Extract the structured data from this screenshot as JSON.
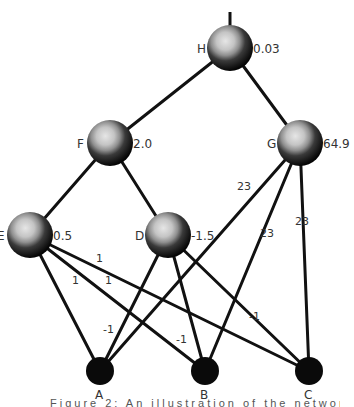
{
  "diagram": {
    "type": "neural-network",
    "nodes": [
      {
        "id": "H",
        "label": "H",
        "value": "0.03",
        "x": 230,
        "y": 48,
        "kind": "hidden"
      },
      {
        "id": "F",
        "label": "F",
        "value": "2.0",
        "x": 110,
        "y": 143,
        "kind": "hidden"
      },
      {
        "id": "G",
        "label": "G",
        "value": "64.9",
        "x": 300,
        "y": 143,
        "kind": "hidden"
      },
      {
        "id": "E",
        "label": "E",
        "value": "0.5",
        "x": 30,
        "y": 235,
        "kind": "hidden"
      },
      {
        "id": "D",
        "label": "D",
        "value": "-1.5",
        "x": 168,
        "y": 235,
        "kind": "hidden"
      },
      {
        "id": "A",
        "label": "A",
        "x": 100,
        "y": 371,
        "kind": "input"
      },
      {
        "id": "B",
        "label": "B",
        "x": 205,
        "y": 371,
        "kind": "input"
      },
      {
        "id": "C",
        "label": "C",
        "x": 309,
        "y": 371,
        "kind": "input"
      }
    ],
    "edges": [
      {
        "from": "H",
        "to": "F"
      },
      {
        "from": "H",
        "to": "G"
      },
      {
        "from": "F",
        "to": "E"
      },
      {
        "from": "F",
        "to": "D"
      },
      {
        "from": "E",
        "to": "A",
        "weight": "1"
      },
      {
        "from": "E",
        "to": "B",
        "weight": "1"
      },
      {
        "from": "E",
        "to": "C",
        "weight": "1"
      },
      {
        "from": "D",
        "to": "A",
        "weight": "-1"
      },
      {
        "from": "D",
        "to": "B",
        "weight": "-1"
      },
      {
        "from": "D",
        "to": "C",
        "weight": "-1"
      },
      {
        "from": "G",
        "to": "A",
        "weight": "23"
      },
      {
        "from": "G",
        "to": "B",
        "weight": "23"
      },
      {
        "from": "G",
        "to": "C",
        "weight": "23"
      }
    ],
    "edge_labels": [
      {
        "text": "1",
        "x": 96,
        "y": 262
      },
      {
        "text": "1",
        "x": 72,
        "y": 284
      },
      {
        "text": "1",
        "x": 105,
        "y": 284
      },
      {
        "text": "-1",
        "x": 103,
        "y": 333
      },
      {
        "text": "-1",
        "x": 176,
        "y": 343
      },
      {
        "text": "-1",
        "x": 249,
        "y": 320
      },
      {
        "text": "23",
        "x": 237,
        "y": 190
      },
      {
        "text": "23",
        "x": 260,
        "y": 237
      },
      {
        "text": "23",
        "x": 295,
        "y": 225
      }
    ],
    "caption": "Figure 2: An illustration of the network ..."
  }
}
